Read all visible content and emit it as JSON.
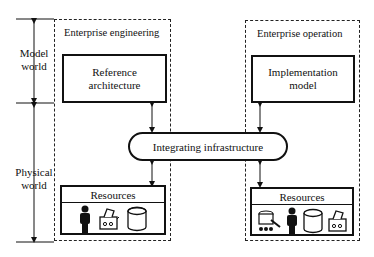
{
  "diagram": {
    "axis": {
      "model_world_label": "Model\nworld",
      "physical_world_label": "Physical\nworld"
    },
    "left_domain": {
      "title": "Enterprise engineering",
      "main_box": "Reference architecture",
      "resources": {
        "label": "Resources",
        "icons": [
          "person-icon",
          "machine-icon",
          "database-icon"
        ]
      }
    },
    "right_domain": {
      "title": "Enterprise operation",
      "main_box": "Implementation model",
      "resources": {
        "label": "Resources",
        "icons": [
          "robot-vehicle-icon",
          "person-icon",
          "database-icon",
          "machine-icon"
        ]
      }
    },
    "center": {
      "label": "Integrating infrastructure"
    }
  }
}
